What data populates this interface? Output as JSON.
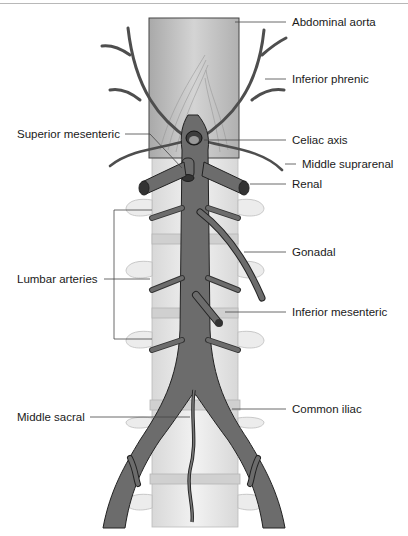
{
  "diagram": {
    "colors": {
      "artery": "#6e6e6e",
      "artery_dark": "#4a4a4a",
      "aorta_wall": "#bdbdbd",
      "vertebra": "#e6e6e6",
      "leader": "#444444"
    },
    "labels": {
      "abdominal_aorta": "Abdominal aorta",
      "inferior_phrenic": "Inferior phrenic",
      "superior_mesenteric": "Superior mesenteric",
      "celiac_axis": "Celiac axis",
      "middle_suprarenal": "Middle suprarenal",
      "renal": "Renal",
      "gonadal": "Gonadal",
      "lumbar_arteries": "Lumbar arteries",
      "inferior_mesenteric": "Inferior mesenteric",
      "middle_sacral": "Middle sacral",
      "common_iliac": "Common iliac"
    }
  }
}
